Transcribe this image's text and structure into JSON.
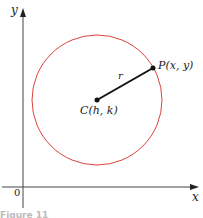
{
  "diagram": {
    "axes": {
      "x_label": "x",
      "y_label": "y",
      "origin_label": "0"
    },
    "circle": {
      "color": "#e0403a",
      "center_label": "C(h, k)",
      "radius_label": "r"
    },
    "point_label": "P(x, y)",
    "caption": "Figure 11"
  }
}
